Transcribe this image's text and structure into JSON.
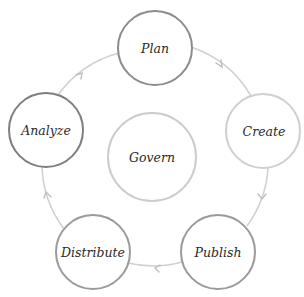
{
  "diagram": {
    "type": "cycle",
    "center": {
      "label": "Govern",
      "cx": 152,
      "cy": 157,
      "r": 44,
      "stroke": "#cccccc"
    },
    "ring": {
      "cx": 153,
      "cy": 157,
      "r": 110,
      "stroke": "#d2d2d2"
    },
    "nodes": [
      {
        "id": "plan",
        "label": "Plan",
        "cx": 155,
        "cy": 48,
        "r": 37,
        "stroke": "#8c8c8c"
      },
      {
        "id": "create",
        "label": "Create",
        "cx": 263,
        "cy": 131,
        "r": 37,
        "stroke": "#cfcfcf"
      },
      {
        "id": "publish",
        "label": "Publish",
        "cx": 218,
        "cy": 252,
        "r": 37,
        "stroke": "#9a9a9a"
      },
      {
        "id": "distribute",
        "label": "Distribute",
        "cx": 93,
        "cy": 252,
        "r": 37,
        "stroke": "#9a9a9a"
      },
      {
        "id": "analyze",
        "label": "Analyze",
        "cx": 46,
        "cy": 130,
        "r": 37,
        "stroke": "#7e7e7e"
      }
    ],
    "flow": [
      "Plan",
      "Create",
      "Publish",
      "Distribute",
      "Analyze",
      "Plan"
    ],
    "arrow_color": "#c4c4c4"
  }
}
